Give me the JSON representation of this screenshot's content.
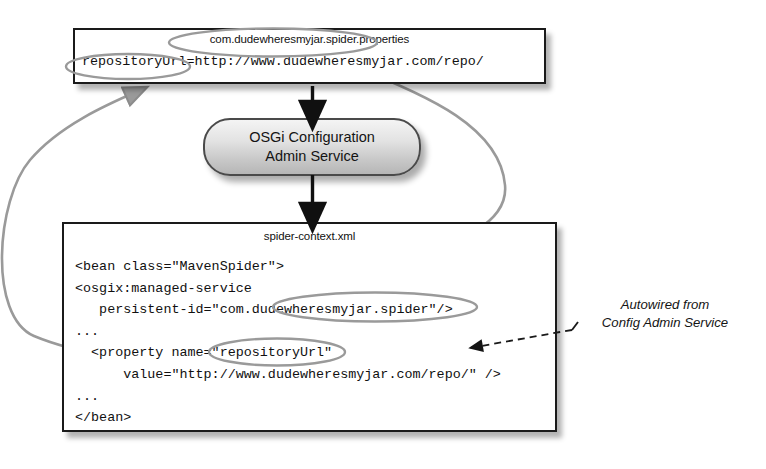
{
  "diagram": {
    "properties_file": {
      "caption": "com.dudewheresmyjar.spider.properties",
      "line": "repositoryUrl=http://www.dudewheresmyjar.com/repo/"
    },
    "service_node": {
      "line1": "OSGi Configuration",
      "line2": "Admin Service"
    },
    "xml_file": {
      "caption": "spider-context.xml",
      "code": "<bean class=\"MavenSpider\">\n<osgix:managed-service\n   persistent-id=\"com.dudewheresmyjar.spider\"/>\n...\n  <property name=\"repositoryUrl\"\n      value=\"http://www.dudewheresmyjar.com/repo/\" />\n...\n</bean>"
    },
    "annotation": {
      "line1": "Autowired from",
      "line2": "Config Admin Service"
    },
    "colors": {
      "box_border": "#1a1a1a",
      "callout_gray": "#8c8c8c",
      "flow_arrow": "#101010",
      "dashed_arrow": "#1a1a1a",
      "node_fill": "#d8d8d8"
    }
  }
}
